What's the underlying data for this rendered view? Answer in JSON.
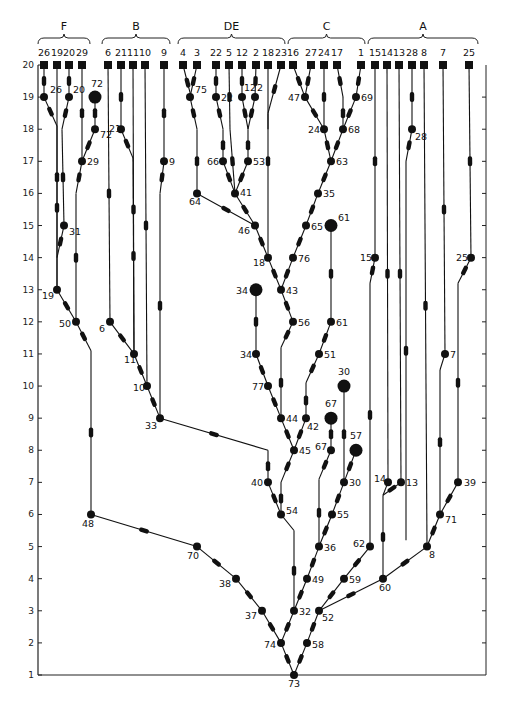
{
  "diagram": {
    "type": "phylogenetic-tree",
    "axis": {
      "label_levels": [
        1,
        2,
        3,
        4,
        5,
        6,
        7,
        8,
        9,
        10,
        11,
        12,
        13,
        14,
        15,
        16,
        17,
        18,
        19,
        20
      ],
      "x": 38,
      "right_x": 486,
      "y_level1": 675,
      "y_level20": 65
    },
    "groups": [
      {
        "label": "F",
        "x1": 38,
        "x2": 90
      },
      {
        "label": "B",
        "x1": 102,
        "x2": 170
      },
      {
        "label": "DE",
        "x1": 178,
        "x2": 285
      },
      {
        "label": "C",
        "x1": 288,
        "x2": 365
      },
      {
        "label": "A",
        "x1": 368,
        "x2": 478
      }
    ],
    "tips": [
      {
        "label": "26",
        "x": 44
      },
      {
        "label": "19",
        "x": 57
      },
      {
        "label": "20",
        "x": 69
      },
      {
        "label": "29",
        "x": 82
      },
      {
        "label": "6",
        "x": 108
      },
      {
        "label": "21",
        "x": 121
      },
      {
        "label": "11",
        "x": 133
      },
      {
        "label": "10",
        "x": 145
      },
      {
        "label": "9",
        "x": 164
      },
      {
        "label": "4",
        "x": 183
      },
      {
        "label": "3",
        "x": 197
      },
      {
        "label": "22",
        "x": 216
      },
      {
        "label": "5",
        "x": 229
      },
      {
        "label": "12",
        "x": 242
      },
      {
        "label": "2",
        "x": 256
      },
      {
        "label": "18",
        "x": 268
      },
      {
        "label": "23",
        "x": 281
      },
      {
        "label": "16",
        "x": 293
      },
      {
        "label": "27",
        "x": 311
      },
      {
        "label": "24",
        "x": 324
      },
      {
        "label": "17",
        "x": 337
      },
      {
        "label": "1",
        "x": 361
      },
      {
        "label": "15",
        "x": 375
      },
      {
        "label": "14",
        "x": 387
      },
      {
        "label": "13",
        "x": 399
      },
      {
        "label": "28",
        "x": 412
      },
      {
        "label": "8",
        "x": 424
      },
      {
        "label": "7",
        "x": 443
      },
      {
        "label": "25",
        "x": 469
      }
    ],
    "nodes": [
      {
        "id": "26",
        "x": 44,
        "lvl": 19,
        "lx": 6,
        "ly": -4
      },
      {
        "id": "20",
        "x": 69,
        "lvl": 19,
        "lx": 4,
        "ly": -4
      },
      {
        "id": "72a",
        "label": "72",
        "x": 95,
        "lvl": 19,
        "big": true,
        "lx": -4,
        "ly": -10
      },
      {
        "id": "72",
        "x": 95,
        "lvl": 18,
        "lx": 5,
        "ly": 9
      },
      {
        "id": "29",
        "x": 82,
        "lvl": 17,
        "lx": 5,
        "ly": 4
      },
      {
        "id": "31",
        "x": 64,
        "lvl": 15,
        "lx": 5,
        "ly": 9
      },
      {
        "id": "19",
        "x": 57,
        "lvl": 13,
        "lx": -15,
        "ly": 9
      },
      {
        "id": "50",
        "x": 76,
        "lvl": 12,
        "lx": -17,
        "ly": 5
      },
      {
        "id": "48",
        "x": 91,
        "lvl": 6,
        "lx": -9,
        "ly": 13
      },
      {
        "id": "21",
        "x": 121,
        "lvl": 18,
        "lx": -12,
        "ly": 3
      },
      {
        "id": "6",
        "x": 110,
        "lvl": 12,
        "lx": -11,
        "ly": 10
      },
      {
        "id": "11",
        "x": 134,
        "lvl": 11,
        "lx": -10,
        "ly": 9
      },
      {
        "id": "10",
        "x": 147,
        "lvl": 10,
        "lx": -14,
        "ly": 5
      },
      {
        "id": "9",
        "x": 164,
        "lvl": 17,
        "lx": 5,
        "ly": 4
      },
      {
        "id": "33",
        "x": 160,
        "lvl": 9,
        "lx": -15,
        "ly": 11
      },
      {
        "id": "75",
        "x": 190,
        "lvl": 19,
        "lx": 5,
        "ly": -4
      },
      {
        "id": "22",
        "x": 216,
        "lvl": 19,
        "lx": 5,
        "ly": 4
      },
      {
        "id": "12",
        "x": 242,
        "lvl": 19,
        "lx": 2,
        "ly": -6
      },
      {
        "id": "2",
        "x": 255,
        "lvl": 19,
        "lx": 2,
        "ly": -6
      },
      {
        "id": "66",
        "x": 223,
        "lvl": 17,
        "lx": -16,
        "ly": 4
      },
      {
        "id": "53",
        "x": 248,
        "lvl": 17,
        "lx": 5,
        "ly": 4
      },
      {
        "id": "64",
        "x": 197,
        "lvl": 16,
        "lx": -8,
        "ly": 12
      },
      {
        "id": "41",
        "x": 235,
        "lvl": 16,
        "lx": 5,
        "ly": 3
      },
      {
        "id": "46",
        "x": 255,
        "lvl": 15,
        "lx": -17,
        "ly": 8
      },
      {
        "id": "18",
        "x": 268,
        "lvl": 14,
        "lx": -15,
        "ly": 8
      },
      {
        "id": "47",
        "x": 305,
        "lvl": 19,
        "lx": -17,
        "ly": 4
      },
      {
        "id": "69",
        "x": 356,
        "lvl": 19,
        "lx": 5,
        "ly": 4
      },
      {
        "id": "24",
        "x": 324,
        "lvl": 18,
        "lx": -16,
        "ly": 4
      },
      {
        "id": "68",
        "x": 343,
        "lvl": 18,
        "lx": 5,
        "ly": 4
      },
      {
        "id": "63",
        "x": 331,
        "lvl": 17,
        "lx": 5,
        "ly": 4
      },
      {
        "id": "35",
        "x": 318,
        "lvl": 16,
        "lx": 5,
        "ly": 4
      },
      {
        "id": "61a",
        "label": "61",
        "x": 331,
        "lvl": 15,
        "big": true,
        "lx": 7,
        "ly": -5
      },
      {
        "id": "65",
        "x": 306,
        "lvl": 15,
        "lx": 5,
        "ly": 4
      },
      {
        "id": "76",
        "x": 293,
        "lvl": 14,
        "lx": 5,
        "ly": 4
      },
      {
        "id": "34a",
        "label": "34",
        "x": 256,
        "lvl": 13,
        "big": true,
        "lx": -20,
        "ly": 4
      },
      {
        "id": "43",
        "x": 281,
        "lvl": 13,
        "lx": 5,
        "ly": 4
      },
      {
        "id": "56",
        "x": 293,
        "lvl": 12,
        "lx": 5,
        "ly": 4
      },
      {
        "id": "61",
        "x": 331,
        "lvl": 12,
        "lx": 5,
        "ly": 4
      },
      {
        "id": "34",
        "x": 256,
        "lvl": 11,
        "lx": -16,
        "ly": 4
      },
      {
        "id": "51",
        "x": 319,
        "lvl": 11,
        "lx": 5,
        "ly": 4
      },
      {
        "id": "77",
        "x": 268,
        "lvl": 10,
        "lx": -16,
        "ly": 4
      },
      {
        "id": "30a",
        "label": "30",
        "x": 344,
        "lvl": 10,
        "big": true,
        "lx": -6,
        "ly": -11
      },
      {
        "id": "44",
        "x": 281,
        "lvl": 9,
        "lx": 5,
        "ly": 4
      },
      {
        "id": "42",
        "x": 306,
        "lvl": 9,
        "lx": 1,
        "ly": 12
      },
      {
        "id": "67a",
        "label": "67",
        "x": 331,
        "lvl": 9,
        "big": true,
        "lx": -6,
        "ly": -11
      },
      {
        "id": "45",
        "x": 294,
        "lvl": 8,
        "lx": 5,
        "ly": 4
      },
      {
        "id": "67",
        "x": 331,
        "lvl": 8,
        "lx": -16,
        "ly": 0
      },
      {
        "id": "57",
        "x": 356,
        "lvl": 8,
        "big": true,
        "lx": -6,
        "ly": -11
      },
      {
        "id": "40",
        "x": 268,
        "lvl": 7,
        "lx": -17,
        "ly": 4
      },
      {
        "id": "30",
        "x": 344,
        "lvl": 7,
        "lx": 5,
        "ly": 4
      },
      {
        "id": "14",
        "x": 388,
        "lvl": 7,
        "lx": -14,
        "ly": 0
      },
      {
        "id": "13",
        "x": 401,
        "lvl": 7,
        "lx": 5,
        "ly": 4
      },
      {
        "id": "54",
        "x": 281,
        "lvl": 6,
        "lx": 5,
        "ly": 0
      },
      {
        "id": "55",
        "x": 332,
        "lvl": 6,
        "lx": 5,
        "ly": 4
      },
      {
        "id": "62",
        "x": 370,
        "lvl": 5,
        "lx": -17,
        "ly": 0
      },
      {
        "id": "8",
        "x": 427,
        "lvl": 5,
        "lx": 2,
        "ly": 11
      },
      {
        "id": "7",
        "x": 445,
        "lvl": 11,
        "lx": 5,
        "ly": 4
      },
      {
        "id": "15",
        "x": 375,
        "lvl": 14,
        "lx": -15,
        "ly": 3
      },
      {
        "id": "25",
        "x": 471,
        "lvl": 14,
        "lx": -15,
        "ly": 3
      },
      {
        "id": "28",
        "x": 412,
        "lvl": 18,
        "lx": 3,
        "ly": 11
      },
      {
        "id": "39",
        "x": 458,
        "lvl": 7,
        "lx": 6,
        "ly": 4
      },
      {
        "id": "71",
        "x": 440,
        "lvl": 6,
        "lx": 5,
        "ly": 9
      },
      {
        "id": "70",
        "x": 197,
        "lvl": 5,
        "lx": -10,
        "ly": 12
      },
      {
        "id": "36",
        "x": 319,
        "lvl": 5,
        "lx": 5,
        "ly": 4
      },
      {
        "id": "38",
        "x": 236,
        "lvl": 4,
        "lx": -17,
        "ly": 8
      },
      {
        "id": "49",
        "x": 307,
        "lvl": 4,
        "lx": 5,
        "ly": 4
      },
      {
        "id": "59",
        "x": 344,
        "lvl": 4,
        "lx": 5,
        "ly": 4
      },
      {
        "id": "60",
        "x": 383,
        "lvl": 4,
        "lx": -4,
        "ly": 12
      },
      {
        "id": "37",
        "x": 262,
        "lvl": 3,
        "lx": -17,
        "ly": 8
      },
      {
        "id": "32",
        "x": 294,
        "lvl": 3,
        "lx": 5,
        "ly": 4
      },
      {
        "id": "52",
        "x": 319,
        "lvl": 3,
        "lx": 3,
        "ly": 10
      },
      {
        "id": "74",
        "x": 281,
        "lvl": 2,
        "lx": -17,
        "ly": 5
      },
      {
        "id": "58",
        "x": 307,
        "lvl": 2,
        "lx": 5,
        "ly": 5
      },
      {
        "id": "73",
        "x": 294,
        "lvl": 1,
        "lx": -6,
        "ly": 12
      }
    ],
    "edges": [
      [
        "t:26",
        "26"
      ],
      [
        "t:19",
        "19"
      ],
      [
        "t:20",
        "20"
      ],
      [
        "t:29",
        "29"
      ],
      [
        "26",
        "p:57,18.1"
      ],
      [
        "20",
        "p:62,18"
      ],
      [
        "72a",
        "72"
      ],
      [
        "72",
        "29"
      ],
      [
        "29",
        "p:76,16"
      ],
      [
        "p:62,18",
        "31"
      ],
      [
        "31",
        "p:57,14"
      ],
      [
        "p:57,18.1",
        "19"
      ],
      [
        "19",
        "50"
      ],
      [
        "p:76,16",
        "50"
      ],
      [
        "50",
        "p:91,11.1"
      ],
      [
        "p:91,11.1",
        "48"
      ],
      [
        "t:6",
        "6"
      ],
      [
        "t:21",
        "21"
      ],
      [
        "21",
        "p:133,17.1"
      ],
      [
        "t:11",
        "11"
      ],
      [
        "t:10",
        "10"
      ],
      [
        "t:9",
        "9"
      ],
      [
        "9",
        "p:160,16"
      ],
      [
        "p:160,16",
        "33"
      ],
      [
        "6",
        "11"
      ],
      [
        "11",
        "10"
      ],
      [
        "10",
        "33"
      ],
      [
        "p:133,17.1",
        "11"
      ],
      [
        "t:4",
        "p:192,18.9"
      ],
      [
        "t:3",
        "75"
      ],
      [
        "p:192,18.9",
        "75"
      ],
      [
        "75",
        "p:197,18"
      ],
      [
        "p:197,18",
        "64"
      ],
      [
        "t:22",
        "22"
      ],
      [
        "22",
        "p:223,18"
      ],
      [
        "p:223,18",
        "66"
      ],
      [
        "t:5",
        "p:230,18"
      ],
      [
        "p:230,18",
        "41"
      ],
      [
        "t:12",
        "12"
      ],
      [
        "t:2",
        "2"
      ],
      [
        "12",
        "p:248,18"
      ],
      [
        "2",
        "p:248,18"
      ],
      [
        "p:248,18",
        "53"
      ],
      [
        "66",
        "41"
      ],
      [
        "53",
        "41"
      ],
      [
        "41",
        "46"
      ],
      [
        "64",
        "46"
      ],
      [
        "46",
        "18"
      ],
      [
        "t:18",
        "18"
      ],
      [
        "t:23",
        "p:268,18.5"
      ],
      [
        "p:268,18.5",
        "p:268,18"
      ],
      [
        "t:16",
        "47"
      ],
      [
        "t:27",
        "47"
      ],
      [
        "47",
        "24"
      ],
      [
        "t:24",
        "24"
      ],
      [
        "24",
        "63"
      ],
      [
        "t:17",
        "p:343,19"
      ],
      [
        "t:1",
        "69"
      ],
      [
        "69",
        "68"
      ],
      [
        "p:343,19",
        "68"
      ],
      [
        "68",
        "63"
      ],
      [
        "63",
        "35"
      ],
      [
        "35",
        "65"
      ],
      [
        "65",
        "76"
      ],
      [
        "76",
        "43"
      ],
      [
        "18",
        "43"
      ],
      [
        "43",
        "56"
      ],
      [
        "56",
        "p:281,11.2"
      ],
      [
        "34a",
        "34"
      ],
      [
        "34",
        "77"
      ],
      [
        "77",
        "44"
      ],
      [
        "p:281,11.2",
        "44"
      ],
      [
        "61a",
        "61"
      ],
      [
        "61",
        "51"
      ],
      [
        "51",
        "p:306,10.1"
      ],
      [
        "p:306,10.1",
        "42"
      ],
      [
        "44",
        "45"
      ],
      [
        "42",
        "45"
      ],
      [
        "33",
        "p:268,8"
      ],
      [
        "p:268,8",
        "40"
      ],
      [
        "45",
        "p:281,7"
      ],
      [
        "p:281,7",
        "54"
      ],
      [
        "40",
        "54"
      ],
      [
        "54",
        "p:294,5.5"
      ],
      [
        "p:294,5.5",
        "32"
      ],
      [
        "67a",
        "67"
      ],
      [
        "67",
        "p:319,7.1"
      ],
      [
        "p:319,7.1",
        "36"
      ],
      [
        "30a",
        "30"
      ],
      [
        "57",
        "30"
      ],
      [
        "30",
        "55"
      ],
      [
        "55",
        "36"
      ],
      [
        "36",
        "49"
      ],
      [
        "49",
        "32"
      ],
      [
        "48",
        "70"
      ],
      [
        "70",
        "38"
      ],
      [
        "38",
        "37"
      ],
      [
        "37",
        "74"
      ],
      [
        "32",
        "74"
      ],
      [
        "74",
        "73"
      ],
      [
        "58",
        "73"
      ],
      [
        "52",
        "58"
      ],
      [
        "t:15",
        "15"
      ],
      [
        "15",
        "p:370,13.2"
      ],
      [
        "p:370,13.2",
        "62"
      ],
      [
        "62",
        "59"
      ],
      [
        "59",
        "52"
      ],
      [
        "60",
        "52"
      ],
      [
        "t:14",
        "14"
      ],
      [
        "t:13",
        "13"
      ],
      [
        "14",
        "p:383,6.6"
      ],
      [
        "13",
        "p:383,6.6"
      ],
      [
        "p:383,6.6",
        "60"
      ],
      [
        "t:28",
        "28"
      ],
      [
        "28",
        "p:406,17"
      ],
      [
        "p:406,17",
        "p:406,5.2"
      ],
      [
        "t:8",
        "8"
      ],
      [
        "8",
        "60"
      ],
      [
        "t:7",
        "7"
      ],
      [
        "7",
        "p:440,10.5"
      ],
      [
        "p:440,10.5",
        "71"
      ],
      [
        "t:25",
        "25"
      ],
      [
        "25",
        "p:458,13.2"
      ],
      [
        "p:458,13.2",
        "39"
      ],
      [
        "39",
        "71"
      ],
      [
        "71",
        "8"
      ]
    ],
    "axis_ticks_right": [
      2,
      3,
      4,
      5,
      6,
      7,
      8,
      9,
      10,
      11,
      12,
      13,
      14,
      15,
      16,
      17,
      18,
      19
    ]
  }
}
